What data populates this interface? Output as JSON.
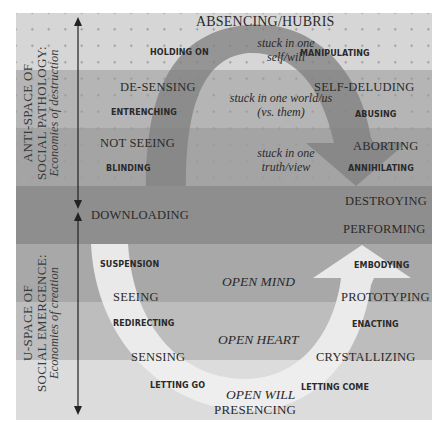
{
  "colors": {
    "band1": "#d6d6d6",
    "band2": "#b5b5b5",
    "band3": "#a4a4a4",
    "band4": "#8e8e8e",
    "band5": "#a8a8a8",
    "band6": "#bdbdbd",
    "band7": "#dcdcdc",
    "dark_arc": "#8a8a8a",
    "light_arc": "#ebebeb"
  },
  "side_labels": {
    "anti_space": {
      "line1": "ANTI-SPACE OF",
      "line2": "SOCIAL PATHOLOGY:",
      "line3": "Economies of destruction"
    },
    "u_space": {
      "line1": "U-SPACE OF",
      "line2": "SOCIAL EMERGENCE:",
      "line3": "Economies of creation"
    }
  },
  "top": {
    "title": "ABSENCING/HUBRIS"
  },
  "anti_space_left": {
    "holding_on": "HOLDING ON",
    "de_sensing": "DE-SENSING",
    "entrenching": "ENTRENCHING",
    "not_seeing": "NOT SEEING",
    "blinding": "BLINDING"
  },
  "anti_space_center": {
    "stuck1_line1": "stuck in one",
    "stuck1_line2": "self/will",
    "stuck2_line1": "stuck in one world/us",
    "stuck2_line2": "(vs. them)",
    "stuck3_line1": "stuck in one",
    "stuck3_line2": "truth/view"
  },
  "anti_space_right": {
    "manipulating": "MANIPULATING",
    "self_deluding": "SELF-DELUDING",
    "abusing": "ABUSING",
    "aborting": "ABORTING",
    "annihilating": "ANNIHILATING"
  },
  "middle": {
    "downloading": "DOWNLOADING",
    "destroying": "DESTROYING",
    "performing": "PERFORMING"
  },
  "u_space_left": {
    "suspension": "SUSPENSION",
    "seeing": "SEEING",
    "redirecting": "REDIRECTING",
    "sensing": "SENSING",
    "letting_go": "LETTING GO"
  },
  "u_space_center": {
    "open_mind": "OPEN MIND",
    "open_heart": "OPEN HEART",
    "open_will": "OPEN WILL"
  },
  "u_space_right": {
    "embodying": "EMBODYING",
    "prototyping": "PROTOTYPING",
    "enacting": "ENACTING",
    "crystallizing": "CRYSTALLIZING",
    "letting_come": "LETTING COME"
  },
  "bottom": {
    "presencing": "PRESENCING"
  }
}
